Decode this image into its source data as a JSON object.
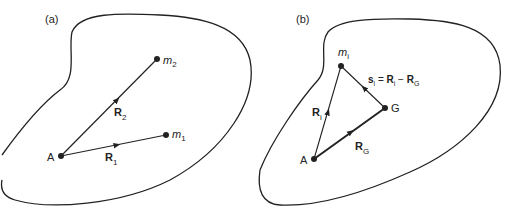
{
  "panel_a": {
    "label": "(a)",
    "points": {
      "A": {
        "name": "A"
      },
      "m1": {
        "base": "m",
        "sub": "1"
      },
      "m2": {
        "base": "m",
        "sub": "2"
      }
    },
    "vectors": {
      "R1": {
        "base": "R",
        "sub": "1"
      },
      "R2": {
        "base": "R",
        "sub": "2"
      }
    }
  },
  "panel_b": {
    "label": "(b)",
    "points": {
      "A": {
        "name": "A"
      },
      "G": {
        "name": "G"
      },
      "mi": {
        "base": "m",
        "sub": "i"
      }
    },
    "vectors": {
      "Ri": {
        "base": "R",
        "sub": "i"
      },
      "RG": {
        "base": "R",
        "sub": "G"
      },
      "si": {
        "base": "s",
        "sub": "i",
        "eq": " = ",
        "r1": "R",
        "r1sub": "i",
        "minus": " − ",
        "r2": "R",
        "r2sub": "G"
      }
    }
  },
  "colors": {
    "stroke": "#222222",
    "background": "#ffffff"
  }
}
